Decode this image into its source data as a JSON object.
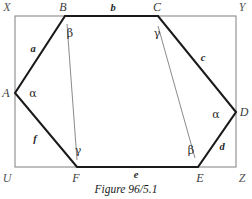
{
  "figure": {
    "caption": "Figure 96/5.1",
    "colors": {
      "hexagon_stroke": "#1a1a1a",
      "rectangle_stroke": "#8a8a8a",
      "thin_line_stroke": "#7d7d7d",
      "background": "#ffffff",
      "label_text": "#1d1d1d"
    },
    "rectangle": {
      "name": "bounding-rectangle",
      "corners": [
        {
          "label": "X",
          "x": 15,
          "y": 16,
          "label_x": 7,
          "label_y": 7
        },
        {
          "label": "Y",
          "x": 236,
          "y": 16,
          "label_x": 242,
          "label_y": 7
        },
        {
          "label": "Z",
          "x": 236,
          "y": 167,
          "label_x": 242,
          "label_y": 178
        },
        {
          "label": "U",
          "x": 15,
          "y": 167,
          "label_x": 7,
          "label_y": 178
        }
      ]
    },
    "hexagon": {
      "name": "hexagon-ABCDEF",
      "vertices": [
        {
          "label": "A",
          "x": 15,
          "y": 93,
          "label_x": 6,
          "label_y": 93
        },
        {
          "label": "B",
          "x": 65,
          "y": 16,
          "label_x": 63,
          "label_y": 7
        },
        {
          "label": "C",
          "x": 158,
          "y": 16,
          "label_x": 157,
          "label_y": 7
        },
        {
          "label": "D",
          "x": 236,
          "y": 112,
          "label_x": 244,
          "label_y": 112
        },
        {
          "label": "E",
          "x": 198,
          "y": 167,
          "label_x": 200,
          "label_y": 178
        },
        {
          "label": "F",
          "x": 77,
          "y": 167,
          "label_x": 76,
          "label_y": 178
        }
      ]
    },
    "sides": [
      {
        "name": "side-a",
        "label": "a",
        "from": "A",
        "to": "B",
        "label_x": 33,
        "label_y": 49
      },
      {
        "name": "side-b",
        "label": "b",
        "from": "B",
        "to": "C",
        "label_x": 113,
        "label_y": 8
      },
      {
        "name": "side-c",
        "label": "c",
        "from": "C",
        "to": "D",
        "label_x": 203,
        "label_y": 58
      },
      {
        "name": "side-d",
        "label": "d",
        "from": "D",
        "to": "E",
        "label_x": 222,
        "label_y": 147
      },
      {
        "name": "side-e",
        "label": "e",
        "from": "E",
        "to": "F",
        "label_x": 136,
        "label_y": 175
      },
      {
        "name": "side-f",
        "label": "f",
        "from": "F",
        "to": "A",
        "label_x": 35,
        "label_y": 139
      }
    ],
    "diagonals": [
      {
        "name": "diagonal-BF",
        "from": "B",
        "to": "F",
        "x1": 67,
        "y1": 24,
        "x2": 77,
        "y2": 160
      },
      {
        "name": "diagonal-CE",
        "from": "C",
        "to": "E",
        "x1": 158,
        "y1": 26,
        "x2": 195,
        "y2": 158
      }
    ],
    "angles": [
      {
        "name": "angle-alpha-at-A",
        "label": "α",
        "at": "A",
        "x": 33,
        "y": 93
      },
      {
        "name": "angle-beta-at-B",
        "label": "β",
        "at": "B",
        "x": 70,
        "y": 33
      },
      {
        "name": "angle-gamma-at-C",
        "label": "γ",
        "at": "C",
        "x": 157,
        "y": 33
      },
      {
        "name": "angle-alpha-at-D",
        "label": "α",
        "at": "D",
        "x": 216,
        "y": 114
      },
      {
        "name": "angle-beta-at-E",
        "label": "β",
        "at": "E",
        "x": 191,
        "y": 150
      },
      {
        "name": "angle-gamma-at-F",
        "label": "γ",
        "at": "F",
        "x": 78,
        "y": 150
      }
    ]
  }
}
